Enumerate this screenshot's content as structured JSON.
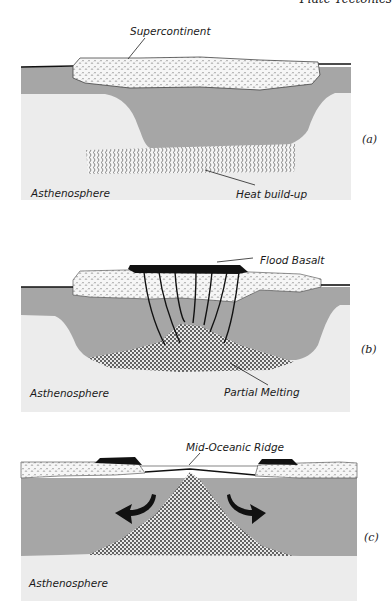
{
  "header": {
    "text": "Plate Tectonics"
  },
  "colors": {
    "lithosphere": "#a6a6a6",
    "asthenosphere": "#ececec",
    "continent_fill": "#f6f6f6",
    "basalt": "#111111",
    "line": "#111111"
  },
  "panels": [
    {
      "id": "a",
      "label": "(a)",
      "asthenosphere_label": "Asthenosphere",
      "callouts": [
        {
          "text": "Supercontinent",
          "target": "supercontinent"
        },
        {
          "text": "Heat build-up",
          "target": "heat-zone"
        }
      ]
    },
    {
      "id": "b",
      "label": "(b)",
      "asthenosphere_label": "Asthenosphere",
      "callouts": [
        {
          "text": "Flood Basalt",
          "target": "flood-basalt"
        },
        {
          "text": "Partial Melting",
          "target": "melt-zone"
        }
      ]
    },
    {
      "id": "c",
      "label": "(c)",
      "asthenosphere_label": "Asthenosphere",
      "callouts": [
        {
          "text": "Mid-Oceanic Ridge",
          "target": "ridge"
        }
      ]
    }
  ]
}
